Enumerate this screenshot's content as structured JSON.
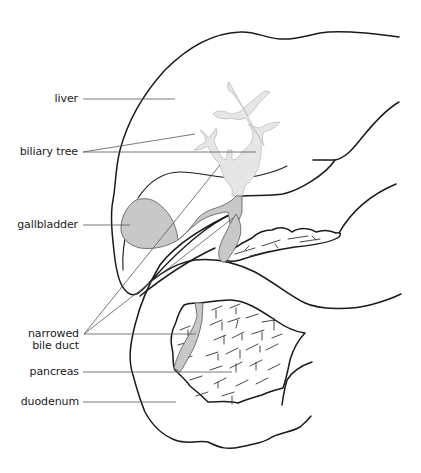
{
  "diagram": {
    "labels": {
      "liver": "liver",
      "biliary_tree": "biliary tree",
      "gallbladder": "gallbladder",
      "narrowed_bile_duct_line1": "narrowed",
      "narrowed_bile_duct_line2": "bile duct",
      "pancreas": "pancreas",
      "duodenum": "duodenum"
    },
    "colors": {
      "outline": "#1a1a1a",
      "gallbladder_fill": "#c8c8c8",
      "biliary_tree_fill": "#e6e6e6",
      "leader_line": "#555555",
      "background": "#ffffff"
    }
  }
}
